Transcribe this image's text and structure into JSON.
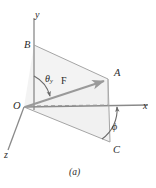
{
  "figure": {
    "caption": "(a)",
    "axes": {
      "x_label": "x",
      "y_label": "y",
      "z_label": "z"
    },
    "points": {
      "origin": "O",
      "b": "B",
      "a": "A",
      "c": "C"
    },
    "vector": {
      "label": "F"
    },
    "angles": {
      "theta_symbol": "θ",
      "theta_subscript": "y",
      "phi_symbol": "ϕ"
    },
    "colors": {
      "line": "#8f8f8f",
      "axis": "#8a8a8a",
      "vector": "#9a9a9a",
      "fill_upper": "#f2f2f2",
      "fill_lower": "#f0f0f0",
      "text": "#2b2b2b",
      "background": "#ffffff"
    },
    "geometry": {
      "origin_px": [
        24,
        107
      ],
      "a_px": [
        108,
        79
      ],
      "b_px": [
        34,
        45
      ],
      "c_px": [
        110,
        142
      ],
      "x_axis_end_px": [
        148,
        107
      ],
      "y_axis_end_px": [
        34,
        18
      ],
      "z_axis_end_px": [
        8,
        150
      ]
    }
  }
}
